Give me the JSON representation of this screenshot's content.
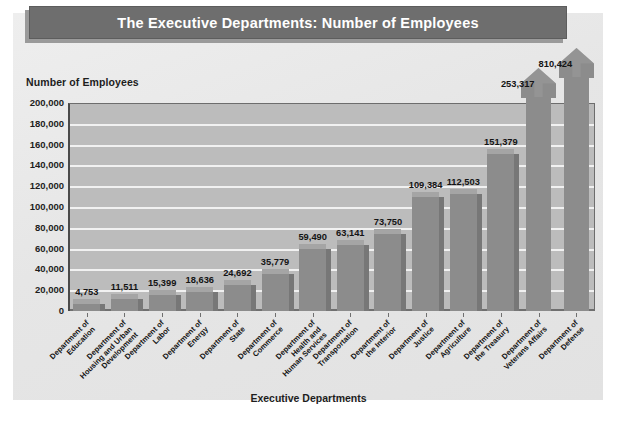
{
  "title": "The Executive Departments: Number of Employees",
  "colors": {
    "title_bar": "#6e6e6e",
    "title_text": "#ffffff",
    "panel": "#e8e8e8",
    "plot_area": "#bcbcbc",
    "gridline": "#f1f1f1",
    "bar_front": "#8c8c8c",
    "bar_top": "#a5a5a5",
    "bar_side": "#777777",
    "axis": "#4a4a4a",
    "text": "#141414"
  },
  "chart_data": {
    "type": "bar",
    "title": "The Executive Departments: Number of Employees",
    "xlabel": "Executive Departments",
    "ylabel": "Number of Employees",
    "ylim": [
      0,
      200000
    ],
    "ytick_labels": [
      "200,000",
      "180,000",
      "160,000",
      "140,000",
      "120,000",
      "100,000",
      "80,000",
      "60,000",
      "40,000",
      "20,000",
      "0"
    ],
    "ytick_values": [
      200000,
      180000,
      160000,
      140000,
      120000,
      100000,
      80000,
      60000,
      40000,
      20000,
      0
    ],
    "grid": true,
    "legend": "none",
    "note": "Last two bars are drawn as upward arrows because their values exceed the 200,000 axis maximum.",
    "categories": [
      "Department of Education",
      "Department of Housing and Urban Development",
      "Department of Labor",
      "Department of Energy",
      "Department of State",
      "Department of Commerce",
      "Department of Health and Human Services",
      "Department of Transportation",
      "Department of the Interior",
      "Department of Justice",
      "Department of Agriculture",
      "Department of the Treasury",
      "Department of Veterans Affairs",
      "Department of Defense"
    ],
    "category_lines": [
      [
        "Department of",
        "Education"
      ],
      [
        "Department of",
        "Housing and Urban",
        "Development"
      ],
      [
        "Department of",
        "Labor"
      ],
      [
        "Department of",
        "Energy"
      ],
      [
        "Department of",
        "State"
      ],
      [
        "Department of",
        "Commerce"
      ],
      [
        "Department of",
        "Health and",
        "Human Services"
      ],
      [
        "Department of",
        "Transportation"
      ],
      [
        "Department of",
        "the Interior"
      ],
      [
        "Department of",
        "Justice"
      ],
      [
        "Department of",
        "Agriculture"
      ],
      [
        "Department of",
        "the Treasury"
      ],
      [
        "Department of",
        "Veterans Affairs"
      ],
      [
        "Department of",
        "Defense"
      ]
    ],
    "values": [
      4753,
      11511,
      15399,
      18636,
      24692,
      35779,
      59490,
      63141,
      73750,
      109384,
      112503,
      151379,
      253317,
      810424
    ],
    "value_labels": [
      "4,753",
      "11,511",
      "15,399",
      "18,636",
      "24,692",
      "35,779",
      "59,490",
      "63,141",
      "73,750",
      "109,384",
      "112,503",
      "151,379",
      "253,317",
      "810,424"
    ]
  }
}
